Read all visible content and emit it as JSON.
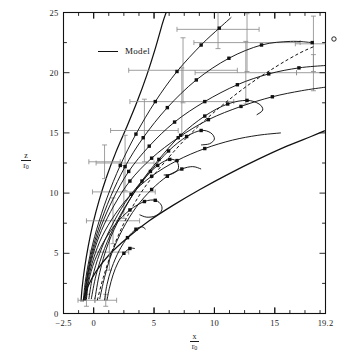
{
  "figure": {
    "background": "#ffffff",
    "ink": "#111111",
    "errorbar_color": "#8e8e8e",
    "dash_color": "#222222"
  },
  "legend": {
    "entries": [
      {
        "label": "Model",
        "style": "solid-line",
        "color": "#111111"
      }
    ]
  },
  "axes": {
    "x": {
      "title_num": "x",
      "title_den": "r",
      "title_den_sub": "0",
      "min": -2.5,
      "max": 19.2,
      "tick_labels": [
        "−2.5",
        "0",
        "5",
        "10",
        "15",
        "19.2"
      ],
      "tick_values": [
        -2.5,
        0,
        5,
        10,
        15,
        19.2
      ],
      "minor_step": 1.25
    },
    "y": {
      "title_num": "z",
      "title_den": "r",
      "title_den_sub": "0",
      "min": 0,
      "max": 25,
      "tick_labels": [
        "0",
        "5",
        "10",
        "15",
        "20",
        "25"
      ],
      "tick_values": [
        0,
        5,
        10,
        15,
        20,
        25
      ],
      "minor_step": 2.5
    }
  },
  "chart_data": {
    "type": "line",
    "title": "",
    "subtitle": "",
    "xlabel": "x/r0",
    "ylabel": "z/r0",
    "xlim": [
      -2.5,
      19.2
    ],
    "ylim": [
      0,
      25
    ],
    "grid": false,
    "legend_position": "upper-left-inside",
    "annotations": [
      {
        "label": "Model",
        "x": 1.6,
        "y": 22.0,
        "type": "legend-text"
      }
    ],
    "outside_markers": [
      {
        "name": "open-circle-right-edge",
        "x": 19.9,
        "y": 22.8,
        "marker": "open-circle"
      }
    ],
    "envelope_curves": [
      {
        "name": "upper-envelope",
        "style": "solid",
        "points": [
          [
            -1.05,
            1.0
          ],
          [
            -0.95,
            2.2
          ],
          [
            -0.75,
            3.8
          ],
          [
            -0.45,
            5.6
          ],
          [
            -0.05,
            7.5
          ],
          [
            0.45,
            9.4
          ],
          [
            1.05,
            11.3
          ],
          [
            1.8,
            13.3
          ],
          [
            2.7,
            15.4
          ],
          [
            3.6,
            17.6
          ],
          [
            4.4,
            19.8
          ],
          [
            5.1,
            22.0
          ],
          [
            5.7,
            24.1
          ],
          [
            6.0,
            25.0
          ]
        ]
      },
      {
        "name": "lower-envelope",
        "style": "solid",
        "points": [
          [
            -0.9,
            1.0
          ],
          [
            -0.5,
            2.2
          ],
          [
            0.2,
            3.5
          ],
          [
            1.3,
            4.9
          ],
          [
            2.8,
            6.3
          ],
          [
            4.6,
            7.7
          ],
          [
            6.6,
            9.0
          ],
          [
            8.8,
            10.3
          ],
          [
            11.2,
            11.6
          ],
          [
            13.6,
            12.8
          ],
          [
            16.0,
            13.9
          ],
          [
            18.0,
            14.7
          ],
          [
            19.2,
            15.2
          ]
        ]
      }
    ],
    "series": [
      {
        "name": "trajectory-1",
        "style": "solid",
        "points": [
          [
            -0.85,
            1.1
          ],
          [
            -0.7,
            2.6
          ],
          [
            -0.35,
            4.6
          ],
          [
            0.25,
            7.0
          ],
          [
            1.1,
            9.6
          ],
          [
            2.2,
            12.3
          ],
          [
            3.5,
            14.9
          ],
          [
            5.1,
            17.6
          ],
          [
            6.9,
            20.1
          ],
          [
            8.9,
            22.3
          ],
          [
            10.4,
            23.7
          ],
          [
            11.4,
            24.6
          ]
        ],
        "markers": [
          [
            2.2,
            12.3
          ],
          [
            3.5,
            14.9
          ],
          [
            5.1,
            17.6
          ],
          [
            6.9,
            20.1
          ],
          [
            8.9,
            22.3
          ],
          [
            10.4,
            23.7
          ]
        ]
      },
      {
        "name": "trajectory-2",
        "style": "solid",
        "points": [
          [
            -0.8,
            1.1
          ],
          [
            -0.6,
            2.8
          ],
          [
            -0.2,
            4.9
          ],
          [
            0.45,
            7.2
          ],
          [
            1.4,
            9.7
          ],
          [
            2.6,
            12.2
          ],
          [
            4.1,
            14.6
          ],
          [
            6.1,
            17.1
          ],
          [
            8.5,
            19.4
          ],
          [
            11.2,
            21.2
          ],
          [
            13.9,
            22.3
          ],
          [
            16.3,
            22.6
          ],
          [
            18.1,
            22.5
          ]
        ],
        "markers": [
          [
            2.6,
            12.2
          ],
          [
            4.1,
            14.6
          ],
          [
            6.1,
            17.1
          ],
          [
            8.5,
            19.4
          ],
          [
            11.2,
            21.2
          ],
          [
            13.9,
            22.3
          ],
          [
            18.1,
            22.5
          ]
        ]
      },
      {
        "name": "trajectory-3",
        "style": "solid",
        "points": [
          [
            -0.75,
            1.1
          ],
          [
            -0.55,
            2.9
          ],
          [
            -0.1,
            5.0
          ],
          [
            0.6,
            7.2
          ],
          [
            1.6,
            9.5
          ],
          [
            2.9,
            11.8
          ],
          [
            4.6,
            13.9
          ],
          [
            6.7,
            15.9
          ],
          [
            9.2,
            17.6
          ],
          [
            11.9,
            19.0
          ],
          [
            14.5,
            19.9
          ],
          [
            17.0,
            20.4
          ],
          [
            19.2,
            20.6
          ]
        ],
        "markers": [
          [
            2.9,
            11.8
          ],
          [
            4.6,
            13.9
          ],
          [
            6.7,
            15.9
          ],
          [
            9.2,
            17.6
          ],
          [
            11.9,
            19.0
          ],
          [
            14.5,
            19.9
          ],
          [
            17.0,
            20.4
          ]
        ]
      },
      {
        "name": "trajectory-4",
        "style": "solid",
        "points": [
          [
            -0.7,
            1.1
          ],
          [
            -0.5,
            2.9
          ],
          [
            -0.05,
            4.9
          ],
          [
            0.65,
            6.9
          ],
          [
            1.7,
            9.0
          ],
          [
            3.0,
            11.0
          ],
          [
            4.8,
            12.9
          ],
          [
            7.0,
            14.6
          ],
          [
            9.5,
            16.1
          ],
          [
            12.2,
            17.2
          ],
          [
            14.8,
            18.0
          ],
          [
            17.2,
            18.5
          ],
          [
            19.2,
            18.8
          ]
        ],
        "markers": [
          [
            3.0,
            11.0
          ],
          [
            4.8,
            12.9
          ],
          [
            7.0,
            14.6
          ],
          [
            9.5,
            16.1
          ],
          [
            12.2,
            17.2
          ],
          [
            14.8,
            18.0
          ]
        ]
      },
      {
        "name": "trajectory-5",
        "style": "solid",
        "points": [
          [
            -0.65,
            1.1
          ],
          [
            -0.45,
            2.8
          ],
          [
            0.0,
            4.6
          ],
          [
            0.7,
            6.4
          ],
          [
            1.75,
            8.2
          ],
          [
            3.1,
            9.9
          ],
          [
            4.8,
            11.4
          ],
          [
            6.9,
            12.7
          ],
          [
            9.2,
            13.7
          ],
          [
            11.5,
            14.4
          ],
          [
            13.6,
            14.8
          ],
          [
            15.5,
            15.0
          ]
        ],
        "markers": [
          [
            3.1,
            9.9
          ],
          [
            4.8,
            11.4
          ],
          [
            6.9,
            12.7
          ],
          [
            9.2,
            13.7
          ]
        ]
      },
      {
        "name": "trajectory-6-loop",
        "style": "solid",
        "points": [
          [
            -0.6,
            1.2
          ],
          [
            -0.4,
            2.7
          ],
          [
            0.05,
            4.3
          ],
          [
            0.8,
            5.9
          ],
          [
            1.8,
            7.4
          ],
          [
            3.0,
            8.6
          ],
          [
            4.2,
            9.3
          ],
          [
            5.1,
            9.4
          ],
          [
            5.6,
            9.0
          ],
          [
            5.6,
            8.5
          ],
          [
            5.1,
            8.1
          ],
          [
            4.4,
            8.0
          ],
          [
            3.8,
            8.2
          ]
        ],
        "markers": [
          [
            3.0,
            8.6
          ],
          [
            4.2,
            9.3
          ],
          [
            5.1,
            9.4
          ]
        ]
      },
      {
        "name": "trajectory-7-loop",
        "style": "solid",
        "points": [
          [
            -0.4,
            1.2
          ],
          [
            -0.1,
            3.0
          ],
          [
            0.5,
            5.0
          ],
          [
            1.4,
            7.1
          ],
          [
            2.6,
            9.2
          ],
          [
            4.0,
            11.0
          ],
          [
            5.3,
            12.3
          ],
          [
            6.3,
            12.8
          ],
          [
            6.9,
            12.6
          ],
          [
            7.0,
            12.0
          ],
          [
            6.5,
            11.6
          ],
          [
            5.8,
            11.5
          ]
        ],
        "markers": [
          [
            4.0,
            11.0
          ],
          [
            5.3,
            12.3
          ],
          [
            6.3,
            12.8
          ]
        ]
      },
      {
        "name": "trajectory-8-loop",
        "style": "solid",
        "points": [
          [
            -0.2,
            1.2
          ],
          [
            0.2,
            3.2
          ],
          [
            0.9,
            5.4
          ],
          [
            1.9,
            7.6
          ],
          [
            3.2,
            9.8
          ],
          [
            4.7,
            11.8
          ],
          [
            6.2,
            13.5
          ],
          [
            7.7,
            14.7
          ],
          [
            8.9,
            15.2
          ],
          [
            9.7,
            15.0
          ],
          [
            10.0,
            14.5
          ],
          [
            9.6,
            14.1
          ],
          [
            8.9,
            14.0
          ]
        ],
        "markers": [
          [
            4.7,
            11.8
          ],
          [
            6.2,
            13.5
          ],
          [
            7.7,
            14.7
          ],
          [
            8.9,
            15.2
          ]
        ]
      },
      {
        "name": "trajectory-9-loop",
        "style": "solid",
        "points": [
          [
            0.1,
            1.2
          ],
          [
            0.5,
            3.4
          ],
          [
            1.2,
            5.8
          ],
          [
            2.3,
            8.2
          ],
          [
            3.7,
            10.6
          ],
          [
            5.4,
            12.8
          ],
          [
            7.2,
            14.8
          ],
          [
            9.2,
            16.4
          ],
          [
            11.1,
            17.4
          ],
          [
            12.7,
            17.7
          ],
          [
            13.7,
            17.4
          ],
          [
            14.0,
            16.9
          ],
          [
            13.5,
            16.5
          ]
        ],
        "markers": [
          [
            5.4,
            12.8
          ],
          [
            7.2,
            14.8
          ],
          [
            9.2,
            16.4
          ],
          [
            11.1,
            17.4
          ],
          [
            12.7,
            17.7
          ]
        ]
      },
      {
        "name": "trajectory-10",
        "style": "solid",
        "points": [
          [
            0.5,
            1.2
          ],
          [
            0.9,
            3.0
          ],
          [
            1.5,
            5.0
          ],
          [
            2.4,
            7.0
          ],
          [
            3.5,
            8.8
          ],
          [
            4.8,
            10.3
          ],
          [
            6.1,
            11.4
          ],
          [
            7.3,
            12.0
          ],
          [
            8.2,
            12.2
          ],
          [
            8.9,
            12.0
          ]
        ],
        "markers": [
          [
            4.8,
            10.3
          ],
          [
            6.1,
            11.4
          ],
          [
            7.3,
            12.0
          ]
        ]
      },
      {
        "name": "trajectory-11-short",
        "style": "solid",
        "points": [
          [
            0.9,
            1.1
          ],
          [
            1.1,
            2.4
          ],
          [
            1.5,
            3.8
          ],
          [
            2.1,
            5.2
          ],
          [
            2.8,
            6.3
          ],
          [
            3.5,
            7.0
          ],
          [
            4.0,
            7.2
          ],
          [
            4.3,
            7.0
          ]
        ],
        "markers": [
          [
            2.8,
            6.3
          ],
          [
            3.5,
            7.0
          ]
        ]
      },
      {
        "name": "trajectory-12-short",
        "style": "solid",
        "points": [
          [
            1.1,
            1.1
          ],
          [
            1.3,
            2.1
          ],
          [
            1.6,
            3.2
          ],
          [
            2.0,
            4.2
          ],
          [
            2.5,
            5.0
          ],
          [
            3.0,
            5.4
          ],
          [
            3.4,
            5.4
          ]
        ],
        "markers": [
          [
            2.5,
            5.0
          ],
          [
            3.0,
            5.4
          ]
        ]
      },
      {
        "name": "trajectory-dashed",
        "style": "dashed",
        "points": [
          [
            0.3,
            1.1
          ],
          [
            0.8,
            3.0
          ],
          [
            1.6,
            5.4
          ],
          [
            2.7,
            7.9
          ],
          [
            4.1,
            10.3
          ],
          [
            5.9,
            12.6
          ],
          [
            8.0,
            14.9
          ],
          [
            10.3,
            17.0
          ],
          [
            12.7,
            18.9
          ],
          [
            15.1,
            20.5
          ],
          [
            17.0,
            21.6
          ],
          [
            18.3,
            22.2
          ]
        ],
        "markers": []
      }
    ],
    "errorbars": [
      {
        "x": 2.6,
        "y": 12.5,
        "xerr": 2.4,
        "yerr": 2.3
      },
      {
        "x": 4.2,
        "y": 15.2,
        "xerr": 2.8,
        "yerr": 2.6
      },
      {
        "x": 7.3,
        "y": 17.6,
        "xerr": 4.3,
        "yerr": 2.8
      },
      {
        "x": 7.4,
        "y": 20.2,
        "xerr": 4.5,
        "yerr": 2.7
      },
      {
        "x": 12.6,
        "y": 20.0,
        "xerr": 4.2,
        "yerr": 2.6
      },
      {
        "x": 12.7,
        "y": 22.5,
        "xerr": 4.4,
        "yerr": 2.4
      },
      {
        "x": 10.3,
        "y": 23.6,
        "xerr": 3.4,
        "yerr": 1.6
      },
      {
        "x": 18.2,
        "y": 22.4,
        "xerr": 1.5,
        "yerr": 2.3
      },
      {
        "x": 18.2,
        "y": 20.0,
        "xerr": 1.4,
        "yerr": 1.5
      },
      {
        "x": 2.5,
        "y": 10.1,
        "xerr": 2.6,
        "yerr": 2.2
      },
      {
        "x": 1.6,
        "y": 7.7,
        "xerr": 2.2,
        "yerr": 1.9
      },
      {
        "x": 1.3,
        "y": 5.1,
        "xerr": 1.6,
        "yerr": 1.5
      },
      {
        "x": 0.9,
        "y": 12.6,
        "xerr": 1.3,
        "yerr": 1.4
      },
      {
        "x": 1.0,
        "y": 1.1,
        "xerr": 0.9,
        "yerr": 0.5
      },
      {
        "x": -0.6,
        "y": 1.1,
        "xerr": 0.7,
        "yerr": 0.5
      }
    ]
  }
}
